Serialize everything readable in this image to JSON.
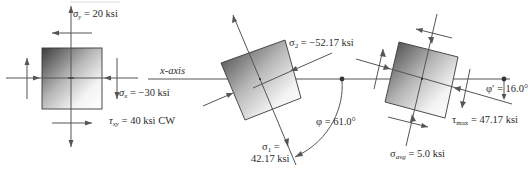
{
  "diagram": {
    "top_caption_cut": "",
    "original_element": {
      "sigma_y": {
        "symbol": "σ",
        "sub": "y",
        "value": " = 20 ksi"
      },
      "sigma_x": {
        "symbol": "σ",
        "sub": "x",
        "value": " = −30 ksi"
      },
      "tau_xy": {
        "symbol": "τ",
        "sub": "xy",
        "value": " = 40 ksi CW"
      }
    },
    "axis_label": "x-axis",
    "principal_element": {
      "sigma_2": {
        "symbol": "σ",
        "sub": "2",
        "value": " = −52.17 ksi"
      },
      "sigma_1": {
        "symbol": "σ",
        "sub": "1",
        "value": " =",
        "value_line2": "42.17 ksi"
      },
      "phi": {
        "symbol": "φ",
        "value": " = 61.0°"
      }
    },
    "max_shear_element": {
      "phi_prime": {
        "symbol": "φ",
        "prime": "′",
        "value": " = 16.0°"
      },
      "tau_max": {
        "symbol": "τ",
        "sub": "max",
        "value": " = 47.17 ksi"
      },
      "sigma_avg": {
        "symbol": "σ",
        "sub": "avg",
        "value": " = 5.0 ksi"
      }
    },
    "colors": {
      "line": "#555555",
      "square_dark": "#3a3a3a",
      "square_light": "#ffffff",
      "text": "#2b2b2b"
    }
  }
}
